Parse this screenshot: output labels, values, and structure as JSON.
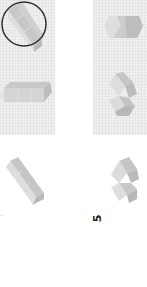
{
  "figure": {
    "panels": [
      {
        "id": "left-panel",
        "shapes": [
          "option-a-circled",
          "option-b"
        ]
      },
      {
        "id": "right-panel",
        "shapes": [
          "option-c",
          "option-d"
        ]
      }
    ],
    "options": [
      {
        "id": "option-a",
        "cubes": 3,
        "orientation": "diagonal",
        "circled": true
      },
      {
        "id": "option-b",
        "cubes": 3,
        "orientation": "horizontal",
        "circled": false
      },
      {
        "id": "option-c",
        "cubes": 2,
        "orientation": "horizontal",
        "circled": false
      },
      {
        "id": "option-d",
        "cubes": 3,
        "orientation": "l-shape",
        "circled": false
      },
      {
        "id": "option-e",
        "cubes": 3,
        "orientation": "diagonal",
        "circled": false
      },
      {
        "id": "option-f",
        "cubes": 3,
        "orientation": "zigzag",
        "circled": false
      }
    ],
    "labels": {
      "left": "'",
      "right": "5"
    },
    "colors": {
      "panel_bg": "#f1f1f1",
      "cube_top": "#c8c8c8",
      "cube_left": "#dedede",
      "cube_right": "#b9b9b9",
      "circle": "#333333"
    }
  }
}
